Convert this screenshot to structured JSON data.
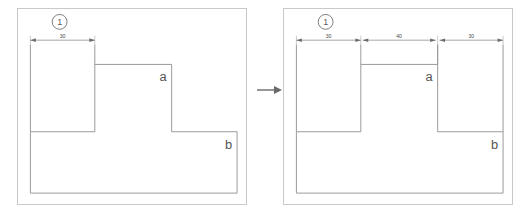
{
  "figure": {
    "title": "",
    "panels": [
      {
        "id": "panel-left",
        "marker": "1",
        "shape_label_a": "a",
        "shape_label_b": "b",
        "dimensions": [
          {
            "value": "30",
            "span": "left-leg-width"
          }
        ],
        "shape_type": "stepped-polygon",
        "description": "L-shaped stepped outline with a tall left block, a middle step and a wide lower base"
      },
      {
        "id": "panel-right",
        "marker": "1",
        "shape_label_a": "a",
        "shape_label_b": "b",
        "dimensions": [
          {
            "value": "30",
            "span": "left-leg-width"
          },
          {
            "value": "40",
            "span": "middle-notch-width"
          },
          {
            "value": "30",
            "span": "right-leg-width"
          }
        ],
        "shape_type": "notched-polygon",
        "description": "U-shaped notched outline with two tall legs, a central notch and a wide lower base"
      }
    ],
    "transition": {
      "icon": "right-arrow-icon",
      "label": ""
    },
    "colors": {
      "shape_stroke": "#9a9a9a",
      "frame_stroke": "#c9c9c9",
      "dimension_stroke": "#8d8d8d",
      "text": "#555555",
      "background": "#ffffff"
    }
  }
}
